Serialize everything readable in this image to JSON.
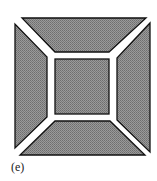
{
  "figure": {
    "label": "(e)",
    "fill_color": "#8a8a8a",
    "stroke_color": "#111111",
    "gap_color": "#ffffff"
  },
  "parts": [
    {
      "name": "top-trapezoid"
    },
    {
      "name": "right-trapezoid"
    },
    {
      "name": "bottom-trapezoid"
    },
    {
      "name": "left-trapezoid"
    },
    {
      "name": "center-square"
    }
  ]
}
